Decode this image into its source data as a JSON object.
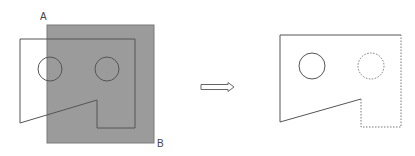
{
  "diagram": {
    "labels": {
      "corner_a": "A",
      "corner_b": "B"
    },
    "colors": {
      "selection_fill": "#9b9b9b",
      "selection_border": "#7a7a7a",
      "line": "#555555",
      "hidden_line": "#777777",
      "arrow": "#666666"
    },
    "before": {
      "selection_box": {
        "x": 47,
        "y": 25,
        "width": 107,
        "height": 118
      },
      "outline_points": "20,39 135,39 135,128 97,128 97,100 20,123",
      "circles": [
        {
          "cx": 50,
          "cy": 69,
          "r": 12
        },
        {
          "cx": 107,
          "cy": 69,
          "r": 12
        }
      ]
    },
    "after": {
      "solid_path": "M401,35 L280,35 L280,122 L361,99",
      "dotted_path": "M361,99 L361,127 L401,127 L401,35",
      "solid_circle": {
        "cx": 312,
        "cy": 66,
        "r": 13
      },
      "dotted_circle": {
        "cx": 371,
        "cy": 66,
        "r": 13
      }
    }
  }
}
